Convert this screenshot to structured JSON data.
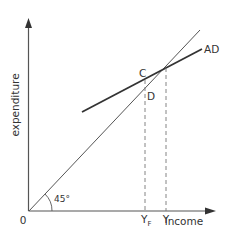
{
  "diagram": {
    "type": "keynesian-cross",
    "axes": {
      "y_label": "expenditure",
      "x_label": "income",
      "origin_label": "0"
    },
    "lines": [
      {
        "name": "45-degree line",
        "angle_label": "45°"
      },
      {
        "name": "aggregate demand",
        "label": "AD"
      }
    ],
    "points": [
      {
        "label": "C"
      },
      {
        "label": "D"
      }
    ],
    "x_ticks": [
      {
        "label": "Y",
        "subscript": "F"
      },
      {
        "label": "Y",
        "subscript": ""
      }
    ],
    "colors": {
      "axis": "#555555",
      "line_45": "#555555",
      "ad_line": "#333333",
      "dashed": "#777777",
      "text": "#333333"
    }
  }
}
